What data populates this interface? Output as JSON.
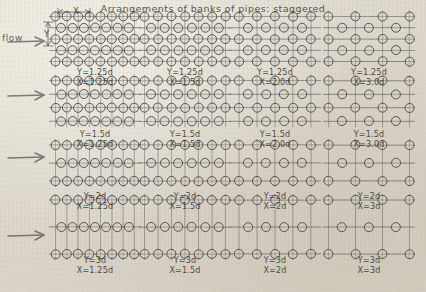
{
  "title": "Arrangements of banks of pipes: staggered",
  "annotations": {
    "flow_label": "flow",
    "x_dim_label": "X",
    "y_dim_label": "Y"
  },
  "icons": {
    "flow_arrow": "right-arrow-icon",
    "x_dimension_arrow": "horizontal-dimension-arrow-icon",
    "y_dimension_arrow": "vertical-dimension-arrow-icon",
    "pipe": "pipe-circle-icon"
  },
  "colors": {
    "ink": "#3a3a3c",
    "paper": "#ddd9cf",
    "pipe_fill": "#d7d2c6"
  },
  "chart_data": {
    "type": "diagram-grid",
    "title": "Arrangements of banks of pipes: staggered",
    "rows": 4,
    "cols": 4,
    "row_param": "Y",
    "col_param": "X",
    "row_values": [
      "1.25d",
      "1.5d",
      "2d",
      "3d"
    ],
    "col_values": [
      "1.25d",
      "1.5d",
      "2d",
      "3d"
    ],
    "cells": [
      {
        "row": 0,
        "col": 0,
        "y": "Y=1.25d",
        "x": "X=1.25d",
        "ynum": 1.25,
        "xnum": 1.25
      },
      {
        "row": 0,
        "col": 1,
        "y": "Y=1.25d",
        "x": "X=1.5d",
        "ynum": 1.25,
        "xnum": 1.5
      },
      {
        "row": 0,
        "col": 2,
        "y": "Y=1.25d",
        "x": "X=2.0d",
        "ynum": 1.25,
        "xnum": 2.0
      },
      {
        "row": 0,
        "col": 3,
        "y": "Y=1.25d",
        "x": "X=3.0d",
        "ynum": 1.25,
        "xnum": 3.0
      },
      {
        "row": 1,
        "col": 0,
        "y": "Y=1.5d",
        "x": "X=1.25d",
        "ynum": 1.5,
        "xnum": 1.25
      },
      {
        "row": 1,
        "col": 1,
        "y": "Y=1.5d",
        "x": "X=1.5d",
        "ynum": 1.5,
        "xnum": 1.5
      },
      {
        "row": 1,
        "col": 2,
        "y": "Y=1.5d",
        "x": "X=2.0d",
        "ynum": 1.5,
        "xnum": 2.0
      },
      {
        "row": 1,
        "col": 3,
        "y": "Y=1.5d",
        "x": "X=3.0d",
        "ynum": 1.5,
        "xnum": 3.0
      },
      {
        "row": 2,
        "col": 0,
        "y": "Y=2d",
        "x": "X=1.25d",
        "ynum": 2.0,
        "xnum": 1.25
      },
      {
        "row": 2,
        "col": 1,
        "y": "Y=2d",
        "x": "X=1.5d",
        "ynum": 2.0,
        "xnum": 1.5
      },
      {
        "row": 2,
        "col": 2,
        "y": "Y=2d",
        "x": "X=2d",
        "ynum": 2.0,
        "xnum": 2.0
      },
      {
        "row": 2,
        "col": 3,
        "y": "Y=2d",
        "x": "X=3d",
        "ynum": 2.0,
        "xnum": 3.0
      },
      {
        "row": 3,
        "col": 0,
        "y": "Y=3d",
        "x": "X=1.25d",
        "ynum": 3.0,
        "xnum": 1.25
      },
      {
        "row": 3,
        "col": 1,
        "y": "Y=3d",
        "x": "X=1.5d",
        "ynum": 3.0,
        "xnum": 1.5
      },
      {
        "row": 3,
        "col": 2,
        "y": "Y=3d",
        "x": "X=2d",
        "ynum": 3.0,
        "xnum": 2.0
      },
      {
        "row": 3,
        "col": 3,
        "y": "Y=3d",
        "x": "X=3d",
        "ynum": 3.0,
        "xnum": 3.0
      }
    ],
    "flow_arrow_count": 4
  }
}
